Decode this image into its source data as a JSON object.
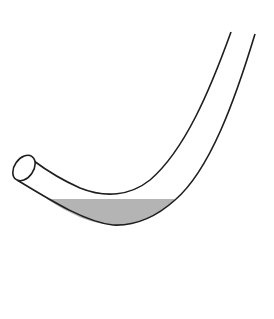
{
  "diagram": {
    "colors": {
      "background": "#ffffff",
      "outline": "#1e1e1e",
      "liquid": "#b4b4b4"
    },
    "labels": []
  }
}
